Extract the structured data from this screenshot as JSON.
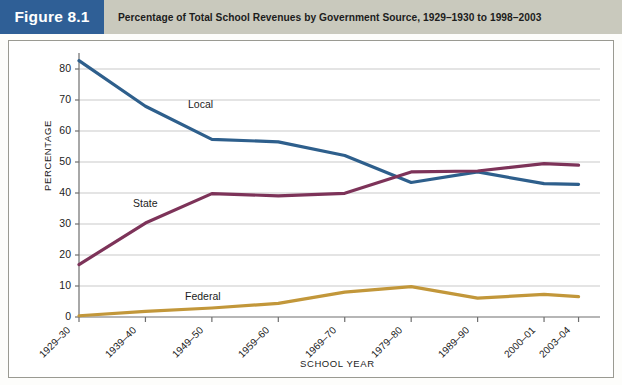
{
  "header": {
    "figure_tag": "Figure 8.1",
    "title": "Percentage of Total School Revenues by Government Source, 1929–1930 to 1998–2003"
  },
  "colors": {
    "tag_background": "#2f5f96",
    "band_background": "#c9c9bd",
    "local": "#2e5f8c",
    "state": "#7d3359",
    "federal": "#c2973a",
    "grid": "#c9c9c9",
    "axis": "#6e6e6e",
    "frame": "#9a9a92"
  },
  "chart_data": {
    "type": "line",
    "title": "Percentage of Total School Revenues by Government Source, 1929–1930 to 1998–2003",
    "xlabel": "SCHOOL YEAR",
    "ylabel": "PERCENTAGE",
    "ylim": [
      0,
      85
    ],
    "yticks": [
      0,
      10,
      20,
      30,
      40,
      50,
      60,
      70,
      80
    ],
    "grid": true,
    "legend": "inline-labels",
    "categories": [
      "1929–30",
      "1939–40",
      "1949–50",
      "1959–60",
      "1969–70",
      "1979–80",
      "1989–90",
      "2000–01",
      "2003–04"
    ],
    "series": [
      {
        "name": "Local",
        "color": "#2e5f8c",
        "values": [
          82.7,
          68.0,
          57.3,
          56.5,
          52.1,
          43.4,
          46.8,
          43.0,
          42.8
        ]
      },
      {
        "name": "State",
        "color": "#7d3359",
        "values": [
          16.9,
          30.3,
          39.8,
          39.1,
          39.9,
          46.8,
          47.1,
          49.5,
          49.0
        ]
      },
      {
        "name": "Federal",
        "color": "#c2973a",
        "values": [
          0.4,
          1.8,
          2.9,
          4.4,
          8.0,
          9.8,
          6.1,
          7.3,
          6.6
        ]
      }
    ]
  },
  "axis_labels": {
    "y_ticks": [
      "0",
      "10",
      "20",
      "30",
      "40",
      "50",
      "60",
      "70",
      "80"
    ],
    "x_ticks": [
      "1929–30",
      "1939–40",
      "1949–50",
      "1959–60",
      "1969–70",
      "1979–80",
      "1989–90",
      "2000–01",
      "2003–04"
    ],
    "x_title": "SCHOOL YEAR",
    "y_title": "PERCENTAGE"
  },
  "series_labels": {
    "local": "Local",
    "state": "State",
    "federal": "Federal"
  }
}
